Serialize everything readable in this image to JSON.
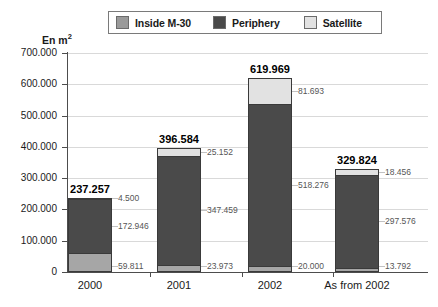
{
  "axis_title": "En m",
  "axis_title_sup": "2",
  "legend": {
    "items": [
      {
        "label": "Inside M-30",
        "color": "#9a9a9a",
        "icon": "legend-swatch-icon"
      },
      {
        "label": "Periphery",
        "color": "#4a4a4a",
        "icon": "legend-swatch-icon"
      },
      {
        "label": "Satellite",
        "color": "#e2e2e2",
        "icon": "legend-swatch-icon"
      }
    ]
  },
  "chart_data": {
    "type": "bar",
    "title": "",
    "subtitle": "",
    "xlabel": "",
    "ylabel": "En m2",
    "stacked": true,
    "grid": true,
    "legend_position": "top",
    "ylim": [
      0,
      700000
    ],
    "ytick_labels": [
      "700.000",
      "600.000",
      "500.000",
      "400.000",
      "300.000",
      "200.000",
      "100.000",
      "0"
    ],
    "ytick_values": [
      700000,
      600000,
      500000,
      400000,
      300000,
      200000,
      100000,
      0
    ],
    "categories": [
      "2000",
      "2001",
      "2002",
      "As from 2002"
    ],
    "series": [
      {
        "name": "Inside M-30",
        "color": "#a6a6a6",
        "values": [
          59811,
          23973,
          20000,
          13792
        ],
        "value_labels": [
          "59.811",
          "23.973",
          "20.000",
          "13.792"
        ]
      },
      {
        "name": "Periphery",
        "color": "#4a4a4a",
        "values": [
          172946,
          347459,
          518276,
          297576
        ],
        "value_labels": [
          "172.946",
          "347.459",
          "518.276",
          "297.576"
        ]
      },
      {
        "name": "Satellite",
        "color": "#e2e2e2",
        "values": [
          4500,
          25152,
          81693,
          18456
        ],
        "value_labels": [
          "4.500",
          "25.152",
          "81.693",
          "18.456"
        ]
      }
    ],
    "totals": [
      237257,
      396584,
      619969,
      329824
    ],
    "total_labels": [
      "237.257",
      "396.584",
      "619.969",
      "329.824"
    ]
  }
}
